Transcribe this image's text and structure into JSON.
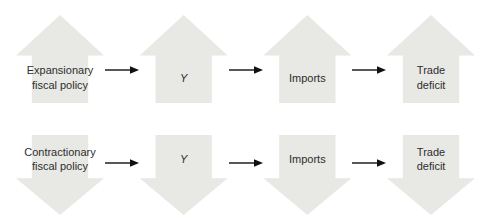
{
  "diagram": {
    "colors": {
      "arrow_fill": "#e8e8e5",
      "connector": "#111111",
      "text": "#2e2e2e",
      "background": "#ffffff"
    },
    "rows": [
      {
        "name": "expansionary",
        "direction": "up",
        "steps": [
          {
            "label": "Expansionary fiscal policy"
          },
          {
            "label": "Y"
          },
          {
            "label": "Imports"
          },
          {
            "label": "Trade deficit"
          }
        ]
      },
      {
        "name": "contractionary",
        "direction": "down",
        "steps": [
          {
            "label": "Contractionary fiscal policy"
          },
          {
            "label": "Y"
          },
          {
            "label": "Imports"
          },
          {
            "label": "Trade deficit"
          }
        ]
      }
    ]
  }
}
